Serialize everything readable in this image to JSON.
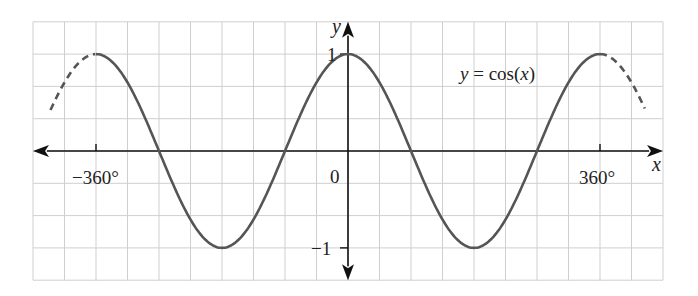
{
  "chart_data": {
    "type": "line",
    "title": "",
    "function_label": "y = cos(x)",
    "function_label_parts": {
      "y": "y",
      "eq": " = cos(",
      "x": "x",
      "close": ")"
    },
    "xlabel": "x",
    "ylabel": "y",
    "x_unit": "degrees",
    "xlim": [
      -450,
      450
    ],
    "ylim": [
      -1.5,
      1.3
    ],
    "grid": true,
    "grid_step_x": 45,
    "grid_step_y": 0.3333,
    "x_tick_labels": [
      {
        "value": -360,
        "label": "−360°"
      },
      {
        "value": 0,
        "label": "0"
      },
      {
        "value": 360,
        "label": "360°"
      }
    ],
    "y_tick_labels": [
      {
        "value": 1,
        "label": "1"
      },
      {
        "value": -1,
        "label": "−1"
      }
    ],
    "series": [
      {
        "name": "y = cos(x)",
        "style": "solid",
        "x_range": [
          -360,
          360
        ],
        "color": "#555555"
      },
      {
        "name": "continuation left",
        "style": "dashed",
        "x_range": [
          -425,
          -360
        ],
        "color": "#555555"
      },
      {
        "name": "continuation right",
        "style": "dashed",
        "x_range": [
          360,
          425
        ],
        "color": "#555555"
      }
    ],
    "key_points": [
      {
        "x": -360,
        "y": 1
      },
      {
        "x": -270,
        "y": 0
      },
      {
        "x": -180,
        "y": -1
      },
      {
        "x": -90,
        "y": 0
      },
      {
        "x": 0,
        "y": 1
      },
      {
        "x": 90,
        "y": 0
      },
      {
        "x": 180,
        "y": -1
      },
      {
        "x": 270,
        "y": 0
      },
      {
        "x": 360,
        "y": 1
      }
    ]
  },
  "colors": {
    "grid": "#cfcfcf",
    "axis": "#111111",
    "curve": "#555555"
  }
}
